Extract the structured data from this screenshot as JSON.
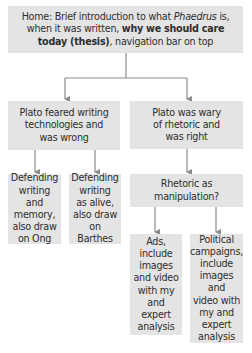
{
  "diagram": {
    "type": "tree",
    "colors": {
      "box_fill": "#e4e4e4",
      "text": "#2e2e2e",
      "connector": "#8c8c8c"
    },
    "root": {
      "parts": [
        {
          "text": "Home: Brief introduction to what ",
          "style": "normal"
        },
        {
          "text": "Phaedrus",
          "style": "italic"
        },
        {
          "text": " is, when it was written, ",
          "style": "normal"
        },
        {
          "text": "why we should care today (thesis)",
          "style": "bold"
        },
        {
          "text": ", navigation bar on top",
          "style": "normal"
        }
      ],
      "line1a": "Home: Brief introduction to what ",
      "line1b": "Phaedrus",
      "line1c": " is,",
      "line2a": "when it was written, ",
      "line2b": "why we should care",
      "line3a": "today (thesis)",
      "line3b": ", navigation bar on top"
    },
    "left": {
      "label": "Plato feared writing technologies and was wrong",
      "lines": [
        "Plato feared writing",
        "technologies and",
        "was wrong"
      ],
      "children": [
        {
          "label": "Defending writing and memory, also draw on Ong",
          "lines": [
            "Defending",
            "writing and",
            "memory,",
            "also draw",
            "on Ong"
          ]
        },
        {
          "label": "Defending writing as alive, also draw on Barthes",
          "lines": [
            "Defending",
            "writing",
            "as alive,",
            "also draw",
            "on Barthes"
          ]
        }
      ]
    },
    "right": {
      "label": "Plato was wary of rhetoric and was right",
      "lines": [
        "Plato was wary",
        "of rhetoric and",
        "was right"
      ],
      "child": {
        "label": "Rhetoric as manipulation?",
        "lines": [
          "Rhetoric as",
          "manipulation?"
        ],
        "children": [
          {
            "label": "Ads, include images and video with my and expert analysis",
            "lines": [
              "Ads,",
              "include",
              "images",
              "and video",
              "with my",
              "and expert",
              "analysis"
            ]
          },
          {
            "label": "Political campaigns, include images and video with my and expert analysis",
            "lines": [
              "Political",
              "campaigns,",
              "include",
              "images and",
              "video with",
              "my and",
              "expert",
              "analysis"
            ]
          }
        ]
      }
    }
  }
}
